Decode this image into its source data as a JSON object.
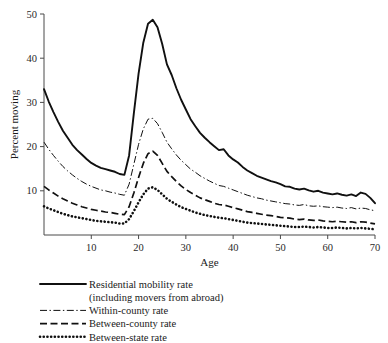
{
  "chart_data": {
    "type": "line",
    "title": "",
    "xlabel": "Age",
    "ylabel": "Percent moving",
    "xlim": [
      0,
      70
    ],
    "ylim": [
      0,
      50
    ],
    "xticks": [
      10,
      20,
      30,
      40,
      50,
      60,
      70
    ],
    "yticks": [
      10,
      20,
      30,
      40,
      50
    ],
    "grid": false,
    "legend_position": "below-left",
    "x": [
      0,
      1,
      2,
      3,
      4,
      5,
      6,
      7,
      8,
      9,
      10,
      11,
      12,
      13,
      14,
      15,
      16,
      17,
      18,
      19,
      20,
      21,
      22,
      23,
      24,
      25,
      26,
      27,
      28,
      29,
      30,
      31,
      32,
      33,
      34,
      35,
      36,
      37,
      38,
      39,
      40,
      41,
      42,
      43,
      44,
      45,
      46,
      47,
      48,
      49,
      50,
      51,
      52,
      53,
      54,
      55,
      56,
      57,
      58,
      59,
      60,
      61,
      62,
      63,
      64,
      65,
      66,
      67,
      68,
      69,
      70
    ],
    "series": [
      {
        "name": "Residential mobility rate",
        "name_line2": "(including movers from abroad)",
        "style": "solid",
        "values": [
          33.0,
          30.2,
          27.8,
          25.6,
          23.6,
          22.0,
          20.4,
          19.2,
          18.2,
          17.2,
          16.3,
          15.7,
          15.2,
          14.9,
          14.6,
          14.3,
          13.8,
          13.6,
          18.0,
          27.5,
          36.5,
          43.5,
          47.8,
          48.7,
          47.0,
          43.2,
          38.6,
          36.2,
          33.2,
          30.6,
          28.4,
          26.2,
          24.6,
          23.1,
          22.0,
          21.0,
          20.1,
          19.2,
          19.4,
          18.0,
          17.1,
          16.4,
          15.4,
          14.6,
          14.0,
          13.4,
          13.0,
          12.6,
          12.2,
          11.9,
          11.5,
          11.0,
          10.9,
          10.5,
          10.3,
          10.5,
          10.1,
          9.8,
          10.0,
          9.6,
          9.4,
          9.2,
          9.4,
          9.1,
          8.9,
          9.2,
          8.8,
          9.6,
          9.3,
          8.4,
          7.2
        ]
      },
      {
        "name": "Within-county rate",
        "style": "dashdot",
        "values": [
          21.0,
          19.4,
          18.0,
          16.7,
          15.5,
          14.5,
          13.6,
          12.8,
          12.1,
          11.5,
          11.0,
          10.6,
          10.2,
          10.0,
          9.7,
          9.5,
          9.2,
          9.0,
          11.5,
          16.0,
          20.5,
          24.0,
          26.2,
          26.4,
          25.2,
          23.2,
          21.0,
          19.5,
          18.1,
          16.9,
          15.9,
          14.9,
          14.2,
          13.4,
          12.8,
          12.2,
          11.7,
          11.2,
          11.0,
          10.6,
          10.2,
          9.8,
          9.4,
          9.0,
          8.7,
          8.4,
          8.2,
          7.9,
          7.7,
          7.5,
          7.3,
          7.1,
          7.0,
          6.8,
          6.7,
          6.9,
          6.6,
          6.5,
          6.6,
          6.4,
          6.3,
          6.2,
          6.3,
          6.1,
          6.0,
          6.2,
          5.9,
          6.1,
          6.0,
          5.7,
          5.5
        ]
      },
      {
        "name": "Between-county rate",
        "style": "dashed",
        "values": [
          11.0,
          10.2,
          9.5,
          8.8,
          8.2,
          7.7,
          7.2,
          6.8,
          6.4,
          6.1,
          5.8,
          5.6,
          5.4,
          5.2,
          5.1,
          4.9,
          4.7,
          4.6,
          6.4,
          9.5,
          13.0,
          16.2,
          18.4,
          19.0,
          18.0,
          16.2,
          14.4,
          13.2,
          12.1,
          11.1,
          10.3,
          9.6,
          9.0,
          8.4,
          8.0,
          7.6,
          7.2,
          6.9,
          6.8,
          6.5,
          6.2,
          5.9,
          5.6,
          5.3,
          5.1,
          4.9,
          4.7,
          4.5,
          4.4,
          4.2,
          4.0,
          3.9,
          3.8,
          3.6,
          3.5,
          3.6,
          3.4,
          3.3,
          3.4,
          3.2,
          3.1,
          3.0,
          3.1,
          3.0,
          2.9,
          3.0,
          2.8,
          3.0,
          2.9,
          2.7,
          2.5
        ]
      },
      {
        "name": "Between-state rate",
        "style": "dotted",
        "values": [
          6.5,
          6.0,
          5.6,
          5.2,
          4.8,
          4.5,
          4.2,
          4.0,
          3.8,
          3.6,
          3.4,
          3.2,
          3.1,
          3.0,
          2.9,
          2.8,
          2.6,
          2.6,
          3.6,
          5.4,
          7.4,
          9.2,
          10.5,
          10.8,
          10.2,
          9.2,
          8.2,
          7.5,
          6.9,
          6.3,
          5.9,
          5.5,
          5.1,
          4.8,
          4.5,
          4.3,
          4.1,
          3.9,
          3.8,
          3.6,
          3.4,
          3.2,
          3.0,
          2.8,
          2.7,
          2.6,
          2.5,
          2.4,
          2.3,
          2.2,
          2.1,
          2.0,
          1.9,
          1.8,
          1.8,
          1.9,
          1.8,
          1.7,
          1.8,
          1.7,
          1.6,
          1.6,
          1.7,
          1.6,
          1.5,
          1.6,
          1.5,
          1.6,
          1.5,
          1.4,
          1.3
        ]
      }
    ],
    "legend": [
      {
        "label": "Residential mobility rate",
        "label_line2": "(including movers from abroad)",
        "style": "solid"
      },
      {
        "label": "Within-county rate",
        "style": "dashdot"
      },
      {
        "label": "Between-county rate",
        "style": "dashed"
      },
      {
        "label": "Between-state rate",
        "style": "dotted"
      }
    ]
  },
  "colors": {
    "ink": "#101010",
    "axis": "#4a4a4a",
    "background": "#ffffff"
  }
}
